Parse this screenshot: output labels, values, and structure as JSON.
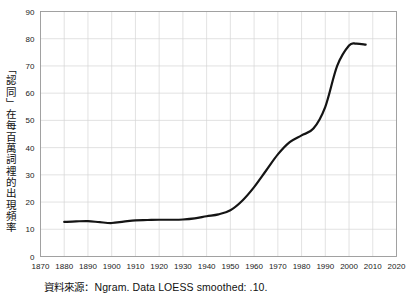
{
  "chart_data": {
    "type": "line",
    "title": "",
    "subtitle": "",
    "xlabel": "",
    "ylabel": "「認同」在每百萬詞裡的出現頻率",
    "source_note": "資料來源：Ngram. Data LOESS smoothed: .10.",
    "xlim": [
      1870,
      2020
    ],
    "ylim": [
      0,
      90
    ],
    "xticks": [
      1870,
      1880,
      1890,
      1900,
      1910,
      1920,
      1930,
      1940,
      1950,
      1960,
      1970,
      1980,
      1990,
      2000,
      2010,
      2020
    ],
    "yticks": [
      0,
      10,
      20,
      30,
      40,
      50,
      60,
      70,
      80,
      90
    ],
    "xtick_labels": [
      "1870",
      "1880",
      "1890",
      "1900",
      "1910",
      "1920",
      "1930",
      "1940",
      "1950",
      "1960",
      "1970",
      "1980",
      "1990",
      "2000",
      "2010",
      "2020"
    ],
    "ytick_labels": [
      "0",
      "10",
      "20",
      "30",
      "40",
      "50",
      "60",
      "70",
      "80",
      "90"
    ],
    "grid": true,
    "grid_color": "#d6d6d6",
    "legend": "none",
    "line_color": "#141414",
    "line_width": 2.2,
    "series": [
      {
        "name": "認同",
        "x": [
          1880,
          1885,
          1890,
          1895,
          1900,
          1905,
          1910,
          1915,
          1920,
          1925,
          1930,
          1935,
          1940,
          1945,
          1950,
          1955,
          1960,
          1965,
          1970,
          1975,
          1980,
          1985,
          1990,
          1995,
          2000,
          2003,
          2007
        ],
        "values": [
          12.7,
          12.9,
          13.0,
          12.6,
          12.3,
          12.8,
          13.3,
          13.4,
          13.5,
          13.5,
          13.6,
          14.0,
          14.8,
          15.5,
          17.0,
          20.5,
          25.5,
          31.5,
          37.5,
          42.0,
          44.5,
          47.0,
          55.0,
          70.0,
          77.5,
          78.2,
          77.8
        ]
      }
    ]
  },
  "axis": {
    "y_label_text": "「認同」在每百萬詞裡的出現頻率"
  },
  "footer": {
    "source_text": "資料來源：Ngram. Data LOESS smoothed: .10."
  }
}
